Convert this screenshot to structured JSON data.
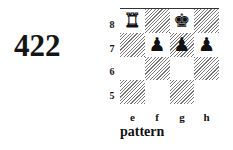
{
  "diagram_number": "422",
  "caption": "pattern",
  "board": {
    "files": [
      "e",
      "f",
      "g",
      "h"
    ],
    "ranks": [
      "8",
      "7",
      "6",
      "5"
    ],
    "squares": [
      {
        "sq": "e8",
        "shade": "light",
        "piece": "♜",
        "piece_name": "white-rook",
        "color": "white"
      },
      {
        "sq": "f8",
        "shade": "dark",
        "piece": "",
        "piece_name": "",
        "color": ""
      },
      {
        "sq": "g8",
        "shade": "light",
        "piece": "♚",
        "piece_name": "black-king",
        "color": "black"
      },
      {
        "sq": "h8",
        "shade": "dark",
        "piece": "",
        "piece_name": "",
        "color": ""
      },
      {
        "sq": "e7",
        "shade": "dark",
        "piece": "",
        "piece_name": "",
        "color": ""
      },
      {
        "sq": "f7",
        "shade": "light",
        "piece": "♟",
        "piece_name": "black-pawn",
        "color": "black"
      },
      {
        "sq": "g7",
        "shade": "dark",
        "piece": "♟",
        "piece_name": "black-pawn",
        "color": "black"
      },
      {
        "sq": "h7",
        "shade": "light",
        "piece": "♟",
        "piece_name": "black-pawn",
        "color": "black"
      },
      {
        "sq": "e6",
        "shade": "light",
        "piece": "",
        "piece_name": "",
        "color": ""
      },
      {
        "sq": "f6",
        "shade": "dark",
        "piece": "",
        "piece_name": "",
        "color": ""
      },
      {
        "sq": "g6",
        "shade": "light",
        "piece": "",
        "piece_name": "",
        "color": ""
      },
      {
        "sq": "h6",
        "shade": "dark",
        "piece": "",
        "piece_name": "",
        "color": ""
      },
      {
        "sq": "e5",
        "shade": "dark",
        "piece": "",
        "piece_name": "",
        "color": ""
      },
      {
        "sq": "f5",
        "shade": "light",
        "piece": "",
        "piece_name": "",
        "color": ""
      },
      {
        "sq": "g5",
        "shade": "dark",
        "piece": "",
        "piece_name": "",
        "color": ""
      },
      {
        "sq": "h5",
        "shade": "light",
        "piece": "",
        "piece_name": "",
        "color": ""
      }
    ]
  }
}
